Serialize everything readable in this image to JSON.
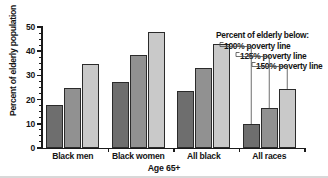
{
  "chart_data": {
    "type": "bar",
    "title": "",
    "subtitle": "",
    "xlabel": "Age 65+",
    "ylabel": "Percent of elderly population",
    "categories": [
      "Black men",
      "Black women",
      "All black",
      "All races"
    ],
    "series": [
      {
        "name": "100% poverty line",
        "color": "#6e6e6e",
        "values": [
          17.7,
          27.3,
          23.6,
          9.9
        ]
      },
      {
        "name": "125% poverty line",
        "color": "#919191",
        "values": [
          25.0,
          38.6,
          32.9,
          16.4
        ]
      },
      {
        "name": "150% poverty line",
        "color": "#c9c9c9",
        "values": [
          34.7,
          48.0,
          42.8,
          24.4
        ]
      }
    ],
    "ylim": [
      0,
      50
    ],
    "yticks": [
      0,
      10,
      20,
      30,
      40,
      50
    ],
    "ytick_labels": [
      "0",
      "10",
      "20",
      "30",
      "40",
      "50"
    ],
    "yminor_step": 2.5,
    "grid": false,
    "legend_position": "upper-right-annotated",
    "legend_title": "Percent of elderly below:",
    "legend_entries": [
      "100% poverty line",
      "125% poverty line",
      "150% poverty line"
    ],
    "annotation_style": "leader-lines-to-bars-in-all-races-group"
  },
  "axes": {
    "y_title": "Percent of elderly population",
    "x_title": "Age 65+"
  },
  "legend": {
    "title": "Percent of elderly below:",
    "items": [
      {
        "label": "100% poverty line"
      },
      {
        "label": "125% poverty line"
      },
      {
        "label": "150% poverty line"
      }
    ]
  },
  "colors": {
    "series_1": "#6e6e6e",
    "series_2": "#919191",
    "series_3": "#c9c9c9",
    "axis": "#1a1a1a",
    "text": "#141414",
    "background": "#ffffff"
  }
}
